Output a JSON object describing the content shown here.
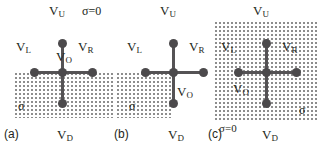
{
  "figure": {
    "width": 319,
    "height": 150,
    "background": "#ffffff",
    "node_color": "#4c4a4c",
    "edge_color": "#555355",
    "stipple_color": "#8d8d8d",
    "text_color": "#231f20"
  },
  "panels": [
    {
      "tag": "(a)",
      "node_labels": {
        "up": "V",
        "up_sub": "U",
        "down": "V",
        "down_sub": "D",
        "left": "V",
        "left_sub": "L",
        "right": "V",
        "right_sub": "R",
        "origin": "V",
        "origin_sub": "O"
      },
      "region_labels": {
        "sigma": "σ",
        "sigma_zero": "σ=0"
      },
      "stipple_region": "bottom-half"
    },
    {
      "tag": "(b)",
      "node_labels": {
        "up": "V",
        "up_sub": "U",
        "down": "V",
        "down_sub": "D",
        "left": "V",
        "left_sub": "L",
        "right": "V",
        "right_sub": "R",
        "origin": "V",
        "origin_sub": "O"
      },
      "region_labels": {
        "sigma": "σ"
      },
      "stipple_region": "bottom-left-quadrant"
    },
    {
      "tag": "(c)",
      "node_labels": {
        "up": "V",
        "up_sub": "U",
        "down": "V",
        "down_sub": "D",
        "left": "V",
        "left_sub": "L",
        "right": "V",
        "right_sub": "R",
        "origin": "V",
        "origin_sub": "O"
      },
      "region_labels": {
        "sigma": "σ",
        "sigma_zero": "σ=0"
      },
      "stipple_region": "full"
    }
  ]
}
